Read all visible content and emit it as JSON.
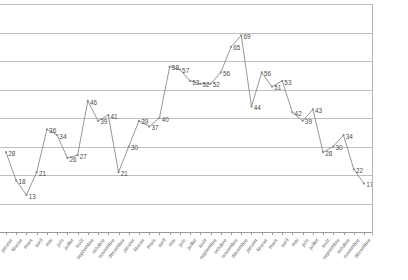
{
  "chart_data": {
    "type": "line",
    "title": "",
    "subtitle": "",
    "xlabel": "",
    "ylabel": "",
    "categories": [
      "janvier",
      "février",
      "mars",
      "avril",
      "mai",
      "juin",
      "juillet",
      "août",
      "septembre",
      "octobre",
      "novembre",
      "décembre",
      "janvier",
      "février",
      "mars",
      "avril",
      "mai",
      "juin",
      "juillet",
      "août",
      "septembre",
      "octobre",
      "novembre",
      "décembre",
      "janvier",
      "février",
      "mars",
      "avril",
      "mai",
      "juin",
      "juillet",
      "août",
      "septembre",
      "octobre",
      "novembre",
      "décembre"
    ],
    "values": [
      28,
      18,
      13,
      21,
      36,
      34,
      26,
      27,
      46,
      39,
      41,
      21,
      30,
      39,
      37,
      40,
      58,
      57,
      53,
      52,
      52,
      56,
      65,
      69,
      44,
      56,
      51,
      53,
      42,
      39,
      43,
      28,
      30,
      34,
      22,
      17
    ],
    "point_labels": [
      "28",
      "18",
      "13",
      "21",
      "36",
      "34",
      "26",
      "27",
      "46",
      "39",
      "41",
      "21",
      "30",
      "39",
      "37",
      "40",
      "58",
      "57",
      "53",
      "52",
      "52",
      "56",
      "65",
      "69",
      "44",
      "56",
      "51",
      "53",
      "42",
      "39",
      "43",
      "28",
      "30",
      "34",
      "22",
      "17"
    ],
    "ylim": [
      0,
      80
    ],
    "yticks": [
      0,
      10,
      20,
      30,
      40,
      50,
      60,
      70,
      80
    ],
    "ytick_labels": [],
    "grid": true,
    "grid_axis": "y",
    "legend": false,
    "legend_position": "none",
    "series": [
      {
        "name": "",
        "color": "#8a8a8a",
        "values": [
          28,
          18,
          13,
          21,
          36,
          34,
          26,
          27,
          46,
          39,
          41,
          21,
          30,
          39,
          37,
          40,
          58,
          57,
          53,
          52,
          52,
          56,
          65,
          69,
          44,
          56,
          51,
          53,
          42,
          39,
          43,
          28,
          30,
          34,
          22,
          17
        ]
      }
    ]
  },
  "colors": {
    "series_line": "#8a8a8a",
    "gridline": "#bfbfbf",
    "axis": "#9a9a9a",
    "label_text": "#4d4d4d",
    "background": "#ffffff"
  }
}
